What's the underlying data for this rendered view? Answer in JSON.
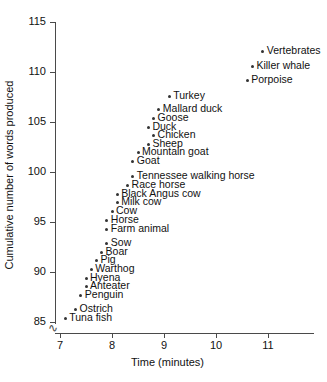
{
  "chart_data": {
    "type": "scatter",
    "title": "",
    "xlabel": "Time (minutes)",
    "ylabel": "Cumulative number of words produced",
    "xlim": [
      6.6,
      11.6
    ],
    "ylim": [
      85,
      115
    ],
    "xticks": [
      7,
      8,
      9,
      10,
      11
    ],
    "yticks": [
      85,
      90,
      95,
      100,
      105,
      110,
      115
    ],
    "grid": false,
    "legend": null,
    "y_axis_break": true,
    "points": [
      {
        "label": "Vertebrates",
        "x": 10.9,
        "y": 112.1
      },
      {
        "label": "Killer whale",
        "x": 10.7,
        "y": 110.6
      },
      {
        "label": "Porpoise",
        "x": 10.6,
        "y": 109.2
      },
      {
        "label": "Turkey",
        "x": 9.1,
        "y": 107.6
      },
      {
        "label": "Mallard duck",
        "x": 8.9,
        "y": 106.3
      },
      {
        "label": "Goose",
        "x": 8.8,
        "y": 105.4
      },
      {
        "label": "Duck",
        "x": 8.7,
        "y": 104.5
      },
      {
        "label": "Chicken",
        "x": 8.8,
        "y": 103.7
      },
      {
        "label": "Sheep",
        "x": 8.7,
        "y": 102.8
      },
      {
        "label": "Mountain goat",
        "x": 8.5,
        "y": 102.0
      },
      {
        "label": "Goat",
        "x": 8.4,
        "y": 101.1
      },
      {
        "label": "Tennessee walking horse",
        "x": 8.4,
        "y": 99.6
      },
      {
        "label": "Race horse",
        "x": 8.3,
        "y": 98.7
      },
      {
        "label": "Black Angus cow",
        "x": 8.1,
        "y": 97.8
      },
      {
        "label": "Milk cow",
        "x": 8.1,
        "y": 97.0
      },
      {
        "label": "Cow",
        "x": 8.0,
        "y": 96.1
      },
      {
        "label": "Horse",
        "x": 7.9,
        "y": 95.2
      },
      {
        "label": "Farm animal",
        "x": 7.9,
        "y": 94.3
      },
      {
        "label": "Sow",
        "x": 7.9,
        "y": 92.9
      },
      {
        "label": "Boar",
        "x": 7.8,
        "y": 92.0
      },
      {
        "label": "Pig",
        "x": 7.7,
        "y": 91.2
      },
      {
        "label": "Warthog",
        "x": 7.6,
        "y": 90.3
      },
      {
        "label": "Hyena",
        "x": 7.5,
        "y": 89.4
      },
      {
        "label": "Anteater",
        "x": 7.5,
        "y": 88.6
      },
      {
        "label": "Penguin",
        "x": 7.4,
        "y": 87.7
      },
      {
        "label": "Ostrich",
        "x": 7.3,
        "y": 86.3
      },
      {
        "label": "Tuna fish",
        "x": 7.1,
        "y": 85.4
      }
    ]
  },
  "colors": {
    "marker": "#333333",
    "axis": "#4a4a4a",
    "text": "#111111",
    "background": "#ffffff"
  },
  "axis_break_glyph": "∿"
}
